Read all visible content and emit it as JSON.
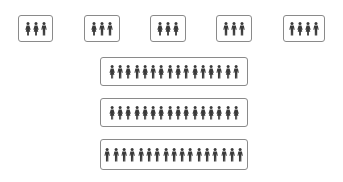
{
  "colors": {
    "figure": "#3a3a3a",
    "border": "#8a8a8a",
    "background": "#ffffff"
  },
  "small_groups": [
    {
      "x": 18,
      "y": 15,
      "w": 35,
      "h": 27,
      "figures": [
        "female",
        "female",
        "male"
      ]
    },
    {
      "x": 84,
      "y": 15,
      "w": 36,
      "h": 27,
      "figures": [
        "female",
        "male",
        "male"
      ]
    },
    {
      "x": 150,
      "y": 15,
      "w": 36,
      "h": 27,
      "figures": [
        "female",
        "female",
        "female"
      ]
    },
    {
      "x": 216,
      "y": 15,
      "w": 36,
      "h": 27,
      "figures": [
        "male",
        "male",
        "male"
      ]
    },
    {
      "x": 283,
      "y": 15,
      "w": 42,
      "h": 27,
      "figures": [
        "male",
        "female",
        "female",
        "male"
      ]
    }
  ],
  "large_groups": [
    {
      "x": 100,
      "y": 57,
      "w": 148,
      "h": 29,
      "figures": [
        "female",
        "male",
        "female",
        "male",
        "female",
        "male",
        "female",
        "male",
        "female",
        "male",
        "female",
        "male",
        "female",
        "male",
        "female",
        "male"
      ]
    },
    {
      "x": 100,
      "y": 98,
      "w": 148,
      "h": 29,
      "figures": [
        "female",
        "female",
        "female",
        "female",
        "female",
        "female",
        "female",
        "female",
        "female",
        "female",
        "female",
        "female",
        "female",
        "female",
        "female",
        "female"
      ]
    },
    {
      "x": 100,
      "y": 139,
      "w": 148,
      "h": 31,
      "figures": [
        "male",
        "male",
        "male",
        "male",
        "male",
        "male",
        "male",
        "male",
        "male",
        "male",
        "male",
        "male",
        "male",
        "male",
        "male",
        "male",
        "male"
      ]
    }
  ]
}
